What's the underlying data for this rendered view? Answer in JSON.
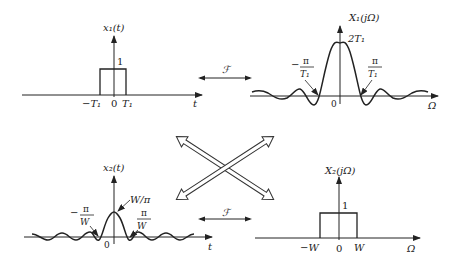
{
  "panels": {
    "top_left": {
      "title": "x₁(t)",
      "height_label": "1",
      "ticks": [
        "−T₁",
        "0",
        "T₁"
      ],
      "axis_label": "t"
    },
    "top_right": {
      "title": "X₁(jΩ)",
      "peak_label": "2T₁",
      "zero_left_num": "π",
      "zero_left_den": "T₁",
      "zero_left_sign": "−",
      "zero_right_num": "π",
      "zero_right_den": "T₁",
      "origin": "0",
      "axis_label": "Ω"
    },
    "bottom_left": {
      "title": "x₂(t)",
      "peak_label": "W/π",
      "zero_left_num": "π",
      "zero_left_den": "W",
      "zero_left_sign": "−",
      "zero_right_num": "π",
      "zero_right_den": "W",
      "origin": "0",
      "axis_label": "t"
    },
    "bottom_right": {
      "title": "X₂(jΩ)",
      "height_label": "1",
      "ticks": [
        "−W",
        "0",
        "W"
      ],
      "axis_label": "Ω"
    }
  },
  "transforms": {
    "top_symbol": "ℱ",
    "bottom_symbol": "ℱ"
  },
  "center": {
    "description": "duality crossing double-headed arrows"
  }
}
